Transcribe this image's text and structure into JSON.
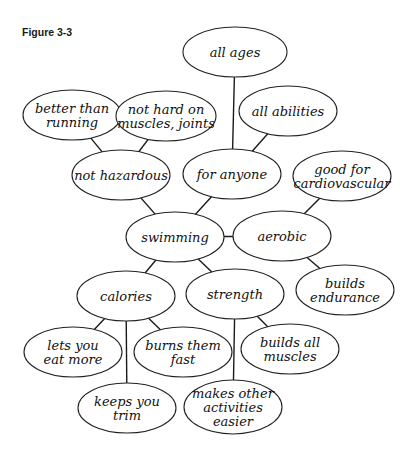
{
  "figure": {
    "title": "Figure 3-3",
    "colors": {
      "stroke": "#222222",
      "background": "#ffffff",
      "text": "#111111"
    }
  },
  "nodes": [
    {
      "id": "all_ages",
      "lines": [
        "all ages"
      ],
      "cx": 235,
      "cy": 52,
      "rx": 52,
      "ry": 25
    },
    {
      "id": "better_than_running",
      "lines": [
        "better than",
        "running"
      ],
      "cx": 72,
      "cy": 115,
      "rx": 49,
      "ry": 25
    },
    {
      "id": "not_hard_on_muscles",
      "lines": [
        "not hard on",
        "muscles, joints"
      ],
      "cx": 166,
      "cy": 116,
      "rx": 50,
      "ry": 25
    },
    {
      "id": "all_abilities",
      "lines": [
        "all abilities"
      ],
      "cx": 288,
      "cy": 111,
      "rx": 49,
      "ry": 25
    },
    {
      "id": "not_hazardous",
      "lines": [
        "not hazardous"
      ],
      "cx": 121,
      "cy": 175,
      "rx": 49,
      "ry": 25
    },
    {
      "id": "for_anyone",
      "lines": [
        "for anyone"
      ],
      "cx": 232,
      "cy": 174,
      "rx": 49,
      "ry": 25
    },
    {
      "id": "good_for_cardio",
      "lines": [
        "good for",
        "cardiovascular"
      ],
      "cx": 342,
      "cy": 176,
      "rx": 49,
      "ry": 25
    },
    {
      "id": "swimming",
      "lines": [
        "swimming"
      ],
      "cx": 175,
      "cy": 237,
      "rx": 49,
      "ry": 25
    },
    {
      "id": "aerobic",
      "lines": [
        "aerobic"
      ],
      "cx": 282,
      "cy": 236,
      "rx": 49,
      "ry": 25
    },
    {
      "id": "calories",
      "lines": [
        "calories"
      ],
      "cx": 126,
      "cy": 296,
      "rx": 49,
      "ry": 25
    },
    {
      "id": "strength",
      "lines": [
        "strength"
      ],
      "cx": 235,
      "cy": 294,
      "rx": 49,
      "ry": 25
    },
    {
      "id": "builds_endurance",
      "lines": [
        "builds",
        "endurance"
      ],
      "cx": 345,
      "cy": 290,
      "rx": 49,
      "ry": 25
    },
    {
      "id": "lets_you_eat_more",
      "lines": [
        "lets you",
        "eat more"
      ],
      "cx": 73,
      "cy": 352,
      "rx": 49,
      "ry": 25
    },
    {
      "id": "burns_them_fast",
      "lines": [
        "burns them",
        "fast"
      ],
      "cx": 183,
      "cy": 352,
      "rx": 49,
      "ry": 25
    },
    {
      "id": "builds_all_muscles",
      "lines": [
        "builds all",
        "muscles"
      ],
      "cx": 290,
      "cy": 349,
      "rx": 49,
      "ry": 25
    },
    {
      "id": "keeps_you_trim",
      "lines": [
        "keeps you",
        "trim"
      ],
      "cx": 127,
      "cy": 408,
      "rx": 49,
      "ry": 25
    },
    {
      "id": "makes_other_activities_easier",
      "lines": [
        "makes other",
        "activities",
        "easier"
      ],
      "cx": 233,
      "cy": 407,
      "rx": 49,
      "ry": 27
    }
  ],
  "edges": [
    [
      "all_ages",
      "for_anyone"
    ],
    [
      "all_abilities",
      "for_anyone"
    ],
    [
      "better_than_running",
      "not_hazardous"
    ],
    [
      "not_hard_on_muscles",
      "not_hazardous"
    ],
    [
      "not_hazardous",
      "swimming"
    ],
    [
      "for_anyone",
      "swimming"
    ],
    [
      "good_for_cardio",
      "aerobic"
    ],
    [
      "swimming",
      "aerobic"
    ],
    [
      "aerobic",
      "builds_endurance"
    ],
    [
      "swimming",
      "calories"
    ],
    [
      "swimming",
      "strength"
    ],
    [
      "calories",
      "lets_you_eat_more"
    ],
    [
      "calories",
      "burns_them_fast"
    ],
    [
      "calories",
      "keeps_you_trim"
    ],
    [
      "strength",
      "builds_all_muscles"
    ],
    [
      "strength",
      "makes_other_activities_easier"
    ]
  ]
}
